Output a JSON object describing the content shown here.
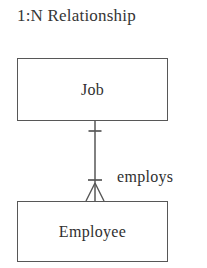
{
  "diagram": {
    "title": "1:N Relationship",
    "type": "entity-relationship-diagram",
    "notation": "crow's-foot",
    "background_color": "#ffffff",
    "line_color": "#575757",
    "text_color": "#2f2f2f",
    "entities": [
      {
        "id": "job",
        "label": "Job",
        "position": "top"
      },
      {
        "id": "employee",
        "label": "Employee",
        "position": "bottom"
      }
    ],
    "relationship": {
      "label": "employs",
      "from": "Job",
      "to": "Employee",
      "cardinality": "1:N",
      "from_marker": "one",
      "to_marker": "many-one"
    }
  }
}
